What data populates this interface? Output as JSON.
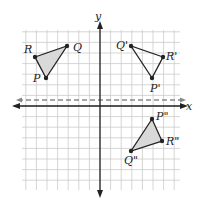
{
  "axes": {
    "x_label": "x",
    "y_label": "y",
    "origin_px": [
      100,
      106
    ],
    "unit_px": 10.6,
    "grid": {
      "x_min_px": 22,
      "x_max_px": 180,
      "y_min_px": 30,
      "y_max_px": 190
    }
  },
  "reflection_line": {
    "type": "dashed",
    "y_px": 100,
    "description": "horizontal dashed line just above x-axis"
  },
  "triangles": [
    {
      "name": "PQR",
      "shaded": true,
      "vertices": [
        {
          "label": "P",
          "px": [
            46,
            78
          ],
          "label_px": [
            33,
            82
          ]
        },
        {
          "label": "Q",
          "px": [
            67,
            46
          ],
          "label_px": [
            73,
            51
          ]
        },
        {
          "label": "R",
          "px": [
            35,
            57
          ],
          "label_px": [
            24,
            53
          ]
        }
      ]
    },
    {
      "name": "P'Q'R'",
      "shaded": false,
      "vertices": [
        {
          "label": "P'",
          "px": [
            152,
            78
          ],
          "label_px": [
            150,
            92
          ]
        },
        {
          "label": "Q'",
          "px": [
            131,
            46
          ],
          "label_px": [
            116,
            49
          ]
        },
        {
          "label": "R'",
          "px": [
            163,
            57
          ],
          "label_px": [
            166,
            60
          ]
        }
      ]
    },
    {
      "name": "P''Q''R''",
      "shaded": true,
      "vertices": [
        {
          "label": "P\"",
          "px": [
            152,
            119
          ],
          "label_px": [
            156,
            120
          ]
        },
        {
          "label": "Q\"",
          "px": [
            131,
            151
          ],
          "label_px": [
            124,
            164
          ]
        },
        {
          "label": "R\"",
          "px": [
            162,
            141
          ],
          "label_px": [
            166,
            145
          ]
        }
      ]
    }
  ],
  "colors": {
    "grid": "#cccccc",
    "axis": "#222222",
    "dashed": "#888888",
    "fill": "#d9d9d9",
    "stroke": "#222222"
  }
}
